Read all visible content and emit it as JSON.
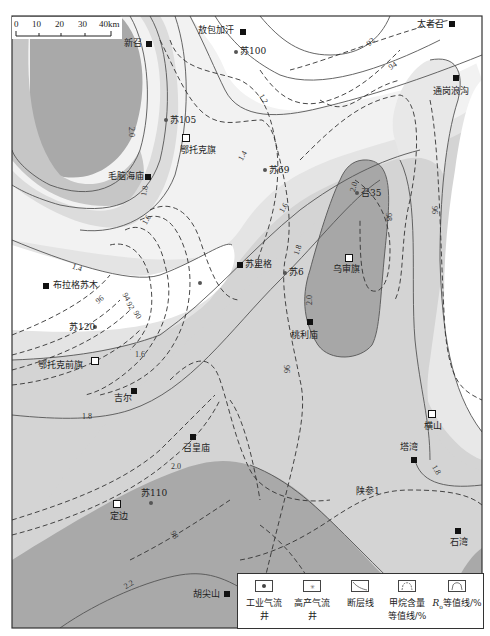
{
  "map": {
    "scale_bar": {
      "ticks": [
        "0",
        "10",
        "20",
        "30",
        "40km"
      ]
    },
    "colors": {
      "c1_2": "#ffffff",
      "c1_4": "#f3f3f3",
      "c1_6": "#e4e4e4",
      "c1_8": "#d2d2d2",
      "c2_0": "#a8a8a8",
      "c2_2": "#a0a0a0",
      "border": "#333333"
    },
    "places": [
      {
        "name": "新召",
        "type": "city",
        "x": 148,
        "y": 43
      },
      {
        "name": "敖包加汗",
        "type": "city",
        "x": 243,
        "y": 31
      },
      {
        "name": "太者召",
        "type": "city",
        "x": 451,
        "y": 23
      },
      {
        "name": "通岗浪沟",
        "type": "city",
        "x": 456,
        "y": 77
      },
      {
        "name": "鄂托克旗",
        "type": "county",
        "x": 186,
        "y": 137
      },
      {
        "name": "毛脑海庙",
        "type": "city",
        "x": 147,
        "y": 176
      },
      {
        "name": "乌审旗",
        "type": "county",
        "x": 348,
        "y": 257
      },
      {
        "name": "苏里格",
        "type": "city",
        "x": 240,
        "y": 264
      },
      {
        "name": "布拉格苏木",
        "type": "city",
        "x": 46,
        "y": 285
      },
      {
        "name": "桃利庙",
        "type": "city",
        "x": 310,
        "y": 321
      },
      {
        "name": "鄂托克前旗",
        "type": "county",
        "x": 94,
        "y": 360
      },
      {
        "name": "吉尔",
        "type": "city",
        "x": 134,
        "y": 390
      },
      {
        "name": "横山",
        "type": "county",
        "x": 432,
        "y": 413
      },
      {
        "name": "召皇庙",
        "type": "city",
        "x": 192,
        "y": 436
      },
      {
        "name": "塔湾",
        "type": "city",
        "x": 413,
        "y": 459
      },
      {
        "name": "定边",
        "type": "county",
        "x": 116,
        "y": 503
      },
      {
        "name": "石湾",
        "type": "city",
        "x": 458,
        "y": 530
      },
      {
        "name": "胡尖山",
        "type": "city",
        "x": 226,
        "y": 593
      }
    ],
    "wells": [
      {
        "name": "苏100",
        "x": 236,
        "y": 52
      },
      {
        "name": "苏105",
        "x": 166,
        "y": 120
      },
      {
        "name": "苏69",
        "x": 265,
        "y": 170
      },
      {
        "name": "召35",
        "x": 357,
        "y": 193
      },
      {
        "name": "苏6",
        "x": 285,
        "y": 272
      },
      {
        "name": "苏120",
        "x": 95,
        "y": 327
      },
      {
        "name": "苏110",
        "x": 151,
        "y": 502
      },
      {
        "name": "陕参1",
        "x": 0,
        "y": 0
      }
    ],
    "ro_contour_labels": [
      "1.2",
      "1.4",
      "1.6",
      "1.8",
      "2.0",
      "2.2"
    ],
    "methane_contour_labels": [
      "90",
      "92",
      "94",
      "96",
      "98"
    ],
    "legend": [
      {
        "label": "工业气流井",
        "icon": "industrial-gas-well-icon"
      },
      {
        "label": "高产气流井",
        "icon": "high-yield-gas-well-icon"
      },
      {
        "label": "断层线",
        "icon": "fault-line-icon"
      },
      {
        "label": "甲烷含量等值线/%",
        "line1": "甲烷含量",
        "line2": "等值线/%",
        "icon": "methane-contour-icon"
      },
      {
        "label": "Ro等值线/%",
        "line1": "R",
        "sub": "o",
        "rest": "等值线/%",
        "icon": "ro-contour-icon"
      }
    ]
  }
}
